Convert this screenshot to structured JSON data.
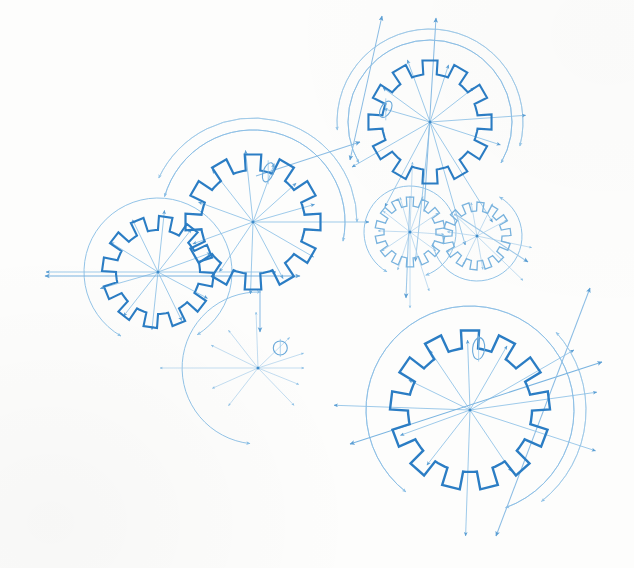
{
  "document": {
    "title": "Gear Assembly Blueprint",
    "medium": "technical line drawing",
    "background_color": "#fdfdfc",
    "ink_primary": "#2b7dc4",
    "ink_secondary": "#7ab4e0",
    "ink_light": "#a9cfeb",
    "ink_faint": "#c6e0f2"
  },
  "chart_data": {
    "type": "diagram",
    "units": "pixels",
    "canvas": {
      "width": 634,
      "height": 568
    },
    "gears": [
      {
        "id": "gear-top-right",
        "label": "Upper gear",
        "cx": 430,
        "cy": 122,
        "teeth": 12,
        "root_radius": 48,
        "tip_radius": 62,
        "tooth_width_deg": 14,
        "phase_deg": -90,
        "stroke": "#2b7dc4",
        "stroke_width": 2.1,
        "pitch_circle_radius": 82,
        "pitch_circle_arcs": [
          [
            150,
            390
          ]
        ],
        "second_arc_radius": 93,
        "second_arc_span": [
          175,
          375
        ],
        "keyway": {
          "angle_deg": 196,
          "radius": 46,
          "rx": 5,
          "ry": 9,
          "rot_deg": 30
        },
        "spokes_deg": [
          18,
          58,
          74,
          96,
          118,
          150,
          196,
          216,
          250,
          288,
          322,
          356
        ],
        "spoke_lengths": [
          74,
          118,
          128,
          140,
          96,
          90,
          48,
          58,
          66,
          60,
          56,
          96
        ]
      },
      {
        "id": "gear-left-large",
        "label": "Centre-left gear",
        "cx": 253,
        "cy": 222,
        "teeth": 12,
        "root_radius": 52,
        "tip_radius": 68,
        "tooth_width_deg": 14,
        "phase_deg": -90,
        "stroke": "#2b7dc4",
        "stroke_width": 2.2,
        "pitch_circle_radius": 92,
        "pitch_circle_arcs": [
          [
            196,
            372
          ]
        ],
        "second_arc_radius": 104,
        "second_arc_span": [
          205,
          360
        ],
        "keyway": {
          "angle_deg": 287,
          "radius": 52,
          "rx": 5,
          "ry": 10,
          "rot_deg": 20
        },
        "spokes_deg": [
          0,
          30,
          62,
          92,
          124,
          160,
          200,
          232,
          264,
          290,
          318,
          344
        ],
        "spoke_lengths": [
          116,
          70,
          64,
          72,
          60,
          64,
          58,
          66,
          72,
          62,
          58,
          64
        ]
      },
      {
        "id": "gear-left-small",
        "label": "Far-left gear",
        "cx": 158,
        "cy": 272,
        "teeth": 12,
        "root_radius": 42,
        "tip_radius": 56,
        "tooth_width_deg": 14,
        "phase_deg": -82,
        "stroke": "#2b7dc4",
        "stroke_width": 2.1,
        "pitch_circle_radius": 74,
        "pitch_circle_arcs": [
          [
            120,
            418
          ]
        ],
        "second_arc_radius": 0,
        "second_arc_span": [
          0,
          0
        ],
        "keyway": null,
        "spokes_deg": [
          0,
          28,
          64,
          96,
          128,
          164,
          180,
          212,
          244,
          276,
          308,
          340
        ],
        "spoke_lengths": [
          118,
          56,
          54,
          58,
          56,
          60,
          112,
          56,
          58,
          62,
          54,
          56
        ]
      },
      {
        "id": "gear-mini-left",
        "label": "Small gear, left of pair",
        "cx": 410,
        "cy": 232,
        "teeth": 14,
        "root_radius": 26,
        "tip_radius": 35,
        "tooth_width_deg": 12,
        "phase_deg": -90,
        "stroke": "#79b3de",
        "stroke_width": 1.3,
        "pitch_circle_radius": 46,
        "pitch_circle_arcs": [
          [
            120,
            430
          ]
        ],
        "second_arc_radius": 0,
        "second_arc_span": [
          0,
          0
        ],
        "keyway": null,
        "spokes_deg": [
          4,
          36,
          72,
          90,
          108,
          146,
          182,
          218,
          254,
          272,
          290,
          326
        ],
        "spoke_lengths": [
          34,
          32,
          62,
          76,
          40,
          34,
          32,
          34,
          36,
          70,
          38,
          34
        ]
      },
      {
        "id": "gear-mini-right",
        "label": "Small gear, right of pair",
        "cx": 477,
        "cy": 236,
        "teeth": 14,
        "root_radius": 25,
        "tip_radius": 34,
        "tooth_width_deg": 12,
        "phase_deg": -84,
        "stroke": "#79b3de",
        "stroke_width": 1.3,
        "pitch_circle_radius": 45,
        "pitch_circle_arcs": [
          [
            300,
            530
          ]
        ],
        "second_arc_radius": 0,
        "second_arc_span": [
          0,
          0
        ],
        "keyway": null,
        "spokes_deg": [
          12,
          44,
          80,
          116,
          152,
          188,
          224,
          260,
          296,
          332
        ],
        "spoke_lengths": [
          56,
          64,
          34,
          32,
          34,
          30,
          32,
          34,
          36,
          34
        ]
      },
      {
        "id": "gear-bottom-right",
        "label": "Lower-right gear",
        "cx": 470,
        "cy": 410,
        "teeth": 13,
        "root_radius": 62,
        "tip_radius": 80,
        "tooth_width_deg": 13,
        "phase_deg": -90,
        "stroke": "#2b7dc4",
        "stroke_width": 2.4,
        "pitch_circle_radius": 104,
        "pitch_circle_arcs": [
          [
            128,
            430
          ]
        ],
        "second_arc_radius": 116,
        "second_arc_span": [
          318,
          412
        ],
        "keyway": {
          "angle_deg": -82,
          "radius": 62,
          "rx": 6,
          "ry": 11,
          "rot_deg": 6
        },
        "spokes_deg": [
          18,
          56,
          92,
          128,
          160,
          182,
          206,
          236,
          268,
          300,
          330,
          352
        ],
        "spoke_lengths": [
          132,
          74,
          126,
          70,
          74,
          136,
          68,
          72,
          70,
          74,
          120,
          128
        ]
      },
      {
        "id": "gear-phantom-centre",
        "label": "Phantom hub, centre",
        "cx": 258,
        "cy": 368,
        "teeth": 0,
        "root_radius": 0,
        "tip_radius": 0,
        "tooth_width_deg": 0,
        "phase_deg": 0,
        "stroke": "#8cc0e6",
        "stroke_width": 1.2,
        "pitch_circle_radius": 76,
        "pitch_circle_arcs": [
          [
            96,
            272
          ]
        ],
        "second_arc_radius": 0,
        "second_arc_span": [
          0,
          0
        ],
        "keyway": {
          "angle_deg": -42,
          "radius": 30,
          "rx": 7,
          "ry": 7,
          "rot_deg": 0
        },
        "spokes_deg": [
          0,
          22,
          46,
          128,
          156,
          180,
          206,
          232,
          268,
          316,
          342
        ],
        "spoke_lengths": [
          46,
          44,
          52,
          48,
          50,
          98,
          52,
          48,
          56,
          44,
          48
        ]
      }
    ],
    "long_dimension_lines": [
      {
        "id": "dim-left-horizontal",
        "x1": 45,
        "y1": 276,
        "x2": 300,
        "y2": 276,
        "arrow_start": true,
        "arrow_end": true,
        "stroke": "#7ab4e0"
      },
      {
        "id": "dim-bottom-right-axis",
        "x1": 350,
        "y1": 444,
        "x2": 602,
        "y2": 362,
        "arrow_start": true,
        "arrow_end": true,
        "stroke": "#7ab4e0"
      },
      {
        "id": "dim-bottom-right-diagonal",
        "x1": 590,
        "y1": 288,
        "x2": 496,
        "y2": 536,
        "arrow_start": true,
        "arrow_end": true,
        "stroke": "#8cbde4"
      },
      {
        "id": "dim-top-gear-vertical",
        "x1": 436,
        "y1": 18,
        "x2": 424,
        "y2": 212,
        "arrow_start": true,
        "arrow_end": false,
        "stroke": "#8cbde4"
      },
      {
        "id": "dim-top-gear-diagonal",
        "x1": 382,
        "y1": 16,
        "x2": 350,
        "y2": 160,
        "arrow_start": true,
        "arrow_end": true,
        "stroke": "#8cbde4"
      },
      {
        "id": "dim-centre-link",
        "x1": 256,
        "y1": 176,
        "x2": 360,
        "y2": 142,
        "arrow_start": false,
        "arrow_end": true,
        "stroke": "#8cbde4"
      },
      {
        "id": "dim-mini-vertical",
        "x1": 410,
        "y1": 196,
        "x2": 406,
        "y2": 298,
        "arrow_start": false,
        "arrow_end": true,
        "stroke": "#9ec8e8"
      },
      {
        "id": "dim-mini-right",
        "x1": 455,
        "y1": 214,
        "x2": 528,
        "y2": 262,
        "arrow_start": false,
        "arrow_end": true,
        "stroke": "#9ec8e8"
      },
      {
        "id": "dim-left-gear-down",
        "x1": 260,
        "y1": 290,
        "x2": 260,
        "y2": 332,
        "arrow_start": false,
        "arrow_end": true,
        "stroke": "#8cbde4"
      }
    ],
    "arc_callouts": [
      {
        "id": "arc-left-a",
        "cx": 253,
        "cy": 222,
        "r": 92,
        "a1": 196,
        "a2": 372,
        "stroke": "#8cbde4"
      },
      {
        "id": "arc-left-b",
        "cx": 253,
        "cy": 222,
        "r": 104,
        "a1": 205,
        "a2": 360,
        "stroke": "#9ec8e8"
      },
      {
        "id": "arc-top-a",
        "cx": 430,
        "cy": 122,
        "r": 82,
        "a1": 150,
        "a2": 390,
        "stroke": "#8cbde4"
      },
      {
        "id": "arc-top-b",
        "cx": 430,
        "cy": 122,
        "r": 93,
        "a1": 175,
        "a2": 375,
        "stroke": "#9ec8e8"
      },
      {
        "id": "arc-bottom-a",
        "cx": 470,
        "cy": 410,
        "r": 104,
        "a1": 128,
        "a2": 430,
        "stroke": "#8cbde4"
      },
      {
        "id": "arc-bottom-b",
        "cx": 470,
        "cy": 410,
        "r": 116,
        "a1": 318,
        "a2": 412,
        "stroke": "#9ec8e8"
      }
    ]
  }
}
